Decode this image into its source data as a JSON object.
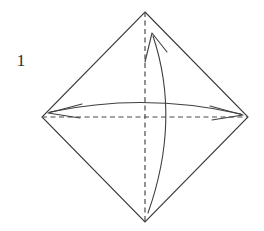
{
  "figure": {
    "kind": "origami-fold-diagram",
    "step_number": "1",
    "caption": "",
    "canvas": {
      "width": 264,
      "height": 231,
      "background": "#ffffff"
    },
    "colors": {
      "outline": "#3a3a3a",
      "crease_dashed": "#4a4a4a",
      "arrow": "#3f3f3f",
      "label_text": "#2b2b2b",
      "background": "#ffffff"
    },
    "shape": {
      "name": "rhombus",
      "label": "Square rotated 45 degrees",
      "vertices": {
        "top": {
          "x": 145,
          "y": 12
        },
        "right": {
          "x": 248,
          "y": 117
        },
        "bottom": {
          "x": 145,
          "y": 222
        },
        "left": {
          "x": 42,
          "y": 117
        }
      },
      "points": "145,12 248,117 145,222 42,117",
      "stroke_width": 1.1
    },
    "creases": [
      {
        "name": "vertical-crease",
        "orientation": "vertical",
        "x1": 145,
        "y1": 12,
        "x2": 145,
        "y2": 222,
        "dash": "5,3.5",
        "stroke_width": 1.2
      },
      {
        "name": "horizontal-crease",
        "orientation": "horizontal",
        "x1": 42,
        "y1": 117,
        "x2": 248,
        "y2": 117,
        "dash": "5,3.5",
        "stroke_width": 1.2
      }
    ],
    "arrows": [
      {
        "name": "horizontal-fold-arrow",
        "direction": "double-headed",
        "description": "Curved arrow arcing upward across the horizontal diagonal, pointing to both the left and right vertices",
        "path": "M 50 112 Q 145 92 241 114",
        "heads": [
          {
            "at": "left",
            "tip_x": 48,
            "tip_y": 113,
            "angle_deg": 192
          },
          {
            "at": "right",
            "tip_x": 243,
            "tip_y": 115,
            "angle_deg": 347
          }
        ],
        "stroke_width": 1.1
      },
      {
        "name": "vertical-fold-arrow",
        "direction": "single-headed-up",
        "description": "Curved arrow bowing to the right, running from the bottom vertex up toward the top vertex",
        "path": "M 148 213 Q 181 120 153 36",
        "heads": [
          {
            "at": "top",
            "tip_x": 152,
            "tip_y": 33,
            "angle_deg": 255
          }
        ],
        "stroke_width": 1.1
      }
    ]
  }
}
